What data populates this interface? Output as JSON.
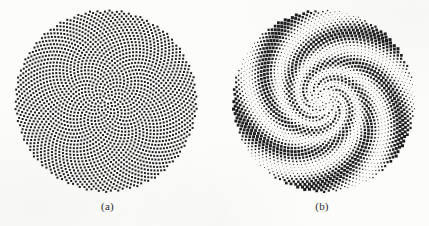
{
  "figure": {
    "background_color": "#fcfcfb",
    "dot_color": "#1d1d1d",
    "width": 429,
    "height": 226
  },
  "panels": [
    {
      "id": "a",
      "caption": "(a)",
      "center_x": 106,
      "center_y": 101,
      "radius": 91
    },
    {
      "id": "b",
      "caption": "(b)",
      "center_x": 109,
      "center_y": 101,
      "radius": 91
    }
  ],
  "chart_data": [
    {
      "type": "scatter",
      "title": "(a)",
      "subtitle": "",
      "xlabel": "",
      "ylabel": "",
      "pattern": "phyllotaxis",
      "divergence_angle_deg": 137.508,
      "point_count": 2200,
      "radial_scale": 1.95,
      "radius_exponent": 0.5,
      "marker": "square",
      "marker_size_px": 2.0,
      "marker_size_varies": false,
      "marker_color": "#1d1d1d",
      "grid": false,
      "legend": null,
      "axis_visible": false,
      "xlim": [
        -91,
        91
      ],
      "ylim": [
        -91,
        91
      ],
      "notes": "Uniform-size dots placed on a Vogel golden-angle spiral lattice; apparent parastichy arcs are a perceptual moire of the uniform lattice."
    },
    {
      "type": "scatter",
      "title": "(b)",
      "subtitle": "",
      "xlabel": "",
      "ylabel": "",
      "pattern": "phyllotaxis",
      "divergence_angle_deg": 137.508,
      "point_count": 2200,
      "radial_scale": 1.95,
      "radius_exponent": 0.5,
      "marker": "square",
      "marker_size_px": 2.6,
      "marker_size_varies": true,
      "marker_size_range_px": [
        0.55,
        3.1
      ],
      "modulation": {
        "kind": "logarithmic-spiral-arms",
        "arm_count": 5,
        "twist": 2.35,
        "radial_fade": "small dots near centre, largest dots near rim"
      },
      "marker_color": "#1d1d1d",
      "grid": false,
      "legend": null,
      "axis_visible": false,
      "xlim": [
        -91,
        91
      ],
      "ylim": [
        -91,
        91
      ],
      "notes": "Same golden-angle lattice as (a) but dot area is modulated by a five-armed logarithmic spiral function, producing visible dark spiral bands."
    }
  ]
}
